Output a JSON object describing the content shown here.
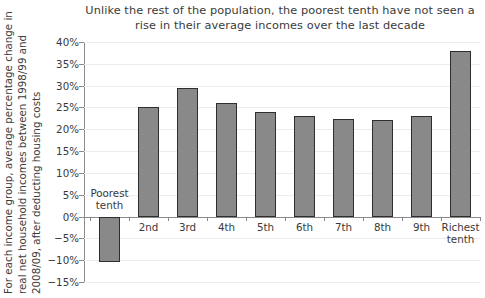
{
  "chart_data": {
    "type": "bar",
    "title": "Unlike the rest of the population, the poorest tenth have not seen a rise in their average incomes over the last decade",
    "title_lines": [
      "Unlike the rest of the population, the poorest tenth have not seen a",
      "rise in their average incomes over the last decade"
    ],
    "xlabel": "",
    "ylabel": "For each income group, average percentage change in real net household incomes between 1998/99 and 2008/09, after deducting housing costs",
    "ylabel_lines": [
      "For each income group, average percentage change in",
      "real net household incomes between 1998/99 and",
      "2008/09, after deducting housing costs"
    ],
    "categories": [
      "Poorest tenth",
      "2nd",
      "3rd",
      "4th",
      "5th",
      "6th",
      "7th",
      "8th",
      "9th",
      "Richest tenth"
    ],
    "category_lines": [
      [
        "Poorest",
        "tenth"
      ],
      [
        "2nd",
        ""
      ],
      [
        "3rd",
        ""
      ],
      [
        "4th",
        ""
      ],
      [
        "5th",
        ""
      ],
      [
        "6th",
        ""
      ],
      [
        "7th",
        ""
      ],
      [
        "8th",
        ""
      ],
      [
        "9th",
        ""
      ],
      [
        "Richest",
        "tenth"
      ]
    ],
    "values": [
      -10.5,
      25.0,
      29.5,
      26.0,
      24.0,
      23.0,
      22.3,
      22.2,
      23.0,
      38.0
    ],
    "ylim": [
      -15,
      40
    ],
    "ytick_values": [
      40,
      35,
      30,
      25,
      20,
      15,
      10,
      5,
      0,
      -5,
      -10,
      -15
    ],
    "ytick_labels": [
      "40%",
      "35%",
      "30%",
      "25%",
      "20%",
      "15%",
      "10%",
      "5%",
      "0%",
      "−5%",
      "−10%",
      "−15%"
    ],
    "grid": true,
    "legend": null,
    "bar_color": "#898989",
    "bar_border_color": "#2e2e2e",
    "text_color": "#3a3a3a",
    "background_color": "#ffffff"
  }
}
